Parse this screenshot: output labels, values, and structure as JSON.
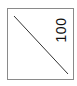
{
  "diagram": {
    "type": "line-in-box",
    "label": "100",
    "label_orientation": "rotated-90-ccw",
    "colors": {
      "border": "#8a8a8a",
      "line": "#333333",
      "text": "#111111",
      "background": "#ffffff"
    }
  }
}
